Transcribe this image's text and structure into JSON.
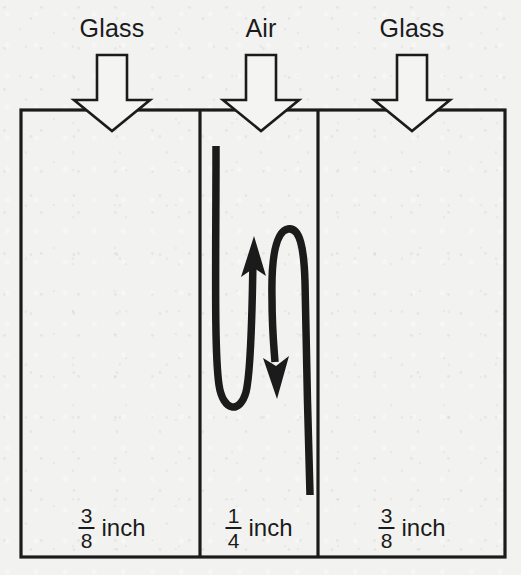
{
  "diagram": {
    "background_color": "#f2f2f0",
    "ink_color": "#1b1b1b",
    "top_labels": [
      {
        "text": "Glass",
        "icon": "arrow-down-outline"
      },
      {
        "text": "Air",
        "icon": "arrow-down-outline"
      },
      {
        "text": "Glass",
        "icon": "arrow-down-outline"
      }
    ],
    "panels": [
      {
        "name": "left-glass-pane",
        "label": "Glass",
        "thickness_numerator": "3",
        "thickness_denominator": "8",
        "thickness_unit": "inch"
      },
      {
        "name": "air-gap",
        "label": "Air",
        "thickness_numerator": "1",
        "thickness_denominator": "4",
        "thickness_unit": "inch"
      },
      {
        "name": "right-glass-pane",
        "label": "Glass",
        "thickness_numerator": "3",
        "thickness_denominator": "8",
        "thickness_unit": "inch"
      }
    ],
    "convection_arrow": {
      "name": "convection-current",
      "description": "S-shaped convection loop inside the air gap",
      "up_arrow_direction": "up",
      "down_arrow_direction": "down"
    }
  }
}
